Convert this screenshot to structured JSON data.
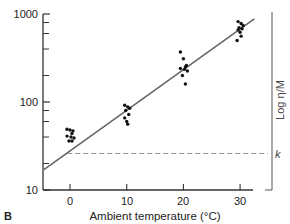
{
  "chart_data": {
    "type": "scatter",
    "panel_label": "B",
    "title": "",
    "xlabel": "Ambient temperature (°C)",
    "ylabel": "",
    "right_label": "Log η/M",
    "yscale": "log",
    "ylim": [
      10,
      1000
    ],
    "xlim": [
      -4.5,
      32.5
    ],
    "x_ticks": [
      0,
      10,
      20,
      30
    ],
    "y_tick_labels": [
      "10",
      "100",
      "1000"
    ],
    "y_minor_ticks": [
      20,
      40,
      60,
      80,
      200,
      400,
      600,
      800
    ],
    "grid": false,
    "legend": null,
    "series": [
      {
        "name": "observations",
        "points": [
          {
            "x": 0,
            "y": 49
          },
          {
            "x": 0,
            "y": 48
          },
          {
            "x": 0,
            "y": 47
          },
          {
            "x": 0,
            "y": 44
          },
          {
            "x": 0,
            "y": 41
          },
          {
            "x": 0,
            "y": 40
          },
          {
            "x": 0,
            "y": 39
          },
          {
            "x": 0,
            "y": 36
          },
          {
            "x": 0,
            "y": 36
          },
          {
            "x": 10,
            "y": 92
          },
          {
            "x": 10,
            "y": 88
          },
          {
            "x": 10,
            "y": 85
          },
          {
            "x": 10,
            "y": 80
          },
          {
            "x": 10,
            "y": 72
          },
          {
            "x": 10,
            "y": 66
          },
          {
            "x": 10,
            "y": 60
          },
          {
            "x": 10,
            "y": 56
          },
          {
            "x": 20,
            "y": 370
          },
          {
            "x": 20,
            "y": 310
          },
          {
            "x": 20,
            "y": 260
          },
          {
            "x": 20,
            "y": 250
          },
          {
            "x": 20,
            "y": 240
          },
          {
            "x": 20,
            "y": 235
          },
          {
            "x": 20,
            "y": 225
          },
          {
            "x": 20,
            "y": 200
          },
          {
            "x": 20,
            "y": 160
          },
          {
            "x": 30,
            "y": 820
          },
          {
            "x": 30,
            "y": 780
          },
          {
            "x": 30,
            "y": 740
          },
          {
            "x": 30,
            "y": 700
          },
          {
            "x": 30,
            "y": 680
          },
          {
            "x": 30,
            "y": 660
          },
          {
            "x": 30,
            "y": 620
          },
          {
            "x": 30,
            "y": 560
          },
          {
            "x": 30,
            "y": 500
          }
        ]
      },
      {
        "name": "regression line",
        "type": "line",
        "points": [
          {
            "x": -4.6,
            "y": 17
          },
          {
            "x": 32.5,
            "y": 880
          }
        ]
      },
      {
        "name": "k",
        "type": "hline",
        "y": 26,
        "label": "k",
        "x_start": -0.5
      }
    ]
  },
  "axis": {
    "x_tick_labels": [
      "0",
      "10",
      "20",
      "30"
    ],
    "y_tick_labels": [
      "10",
      "100",
      "1000"
    ]
  }
}
